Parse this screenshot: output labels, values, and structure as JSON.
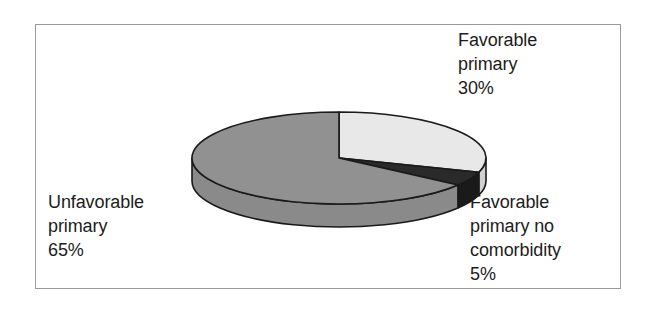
{
  "figure": {
    "background_color": "#ffffff",
    "frame_border_color": "#9a9a9a"
  },
  "chart_data": {
    "type": "pie",
    "title": "",
    "subtitle": "",
    "xlabel": "",
    "ylabel": "",
    "legend_position": "none",
    "grid": false,
    "three_d": true,
    "start_angle_deg": 0,
    "direction": "clockwise",
    "categories": [
      "Favorable primary",
      "Favorable primary no comorbidity",
      "Unfavorable primary"
    ],
    "values": [
      30,
      5,
      65
    ],
    "value_unit": "%",
    "colors": [
      "#e8e8e8",
      "#2a2a2a",
      "#919191"
    ],
    "side_colors": [
      "#d0d0d0",
      "#1a1a1a",
      "#8a8a8a"
    ],
    "outline_color": "#1a1a1a",
    "slices": [
      {
        "label": "Favorable primary",
        "value": 30,
        "value_text": "30%",
        "color": "#e8e8e8",
        "side_color": "#d0d0d0"
      },
      {
        "label": "Favorable primary no comorbidity",
        "value": 5,
        "value_text": "5%",
        "color": "#2a2a2a",
        "side_color": "#1a1a1a"
      },
      {
        "label": "Unfavorable primary",
        "value": 65,
        "value_text": "65%",
        "color": "#919191",
        "side_color": "#8a8a8a"
      }
    ]
  },
  "labels": {
    "favorable_primary": "Favorable\nprimary\n30%",
    "unfavorable_primary": "Unfavorable\nprimary\n65%",
    "favorable_primary_no_comorbidity": "Favorable\nprimary no\ncomorbidity\n5%"
  }
}
